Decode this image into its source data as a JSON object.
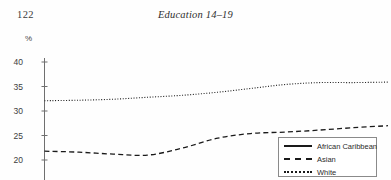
{
  "page": {
    "folio": "122",
    "running_head": "Education 14–19"
  },
  "chart_data": {
    "type": "line",
    "title": "",
    "subtitle": "",
    "xlabel": "",
    "ylabel": "%",
    "ylim": [
      20,
      40
    ],
    "yticks": [
      40,
      35,
      30,
      25,
      20
    ],
    "ytick_labels": [
      "40",
      "35",
      "30",
      "25",
      "20"
    ],
    "grid": false,
    "legend_position": "right",
    "axis_color": "#6f6f6f",
    "line_color": "#1a1a1a",
    "x": [
      0,
      1,
      2,
      3,
      4,
      5,
      6,
      7,
      8,
      9,
      10
    ],
    "series": [
      {
        "name": "African Caribbean",
        "style": "solid",
        "values": [
          null,
          null,
          null,
          null,
          null,
          null,
          13.2,
          14.2,
          null,
          null,
          null
        ],
        "note": "curve enters at lower right, clipped by page crop"
      },
      {
        "name": "Asian",
        "style": "dashed",
        "values": [
          21.8,
          21.6,
          21.2,
          21.0,
          22.4,
          24.4,
          25.4,
          25.7,
          26.1,
          26.6,
          27.0
        ]
      },
      {
        "name": "White",
        "style": "dotted",
        "values": [
          32.1,
          32.2,
          32.4,
          32.8,
          33.2,
          33.8,
          34.6,
          35.4,
          35.8,
          35.8,
          35.9
        ]
      }
    ]
  },
  "legend": {
    "entries": [
      {
        "label": "African Caribbean",
        "style": "solid"
      },
      {
        "label": "Asian",
        "style": "dashed"
      },
      {
        "label": "White",
        "style": "dotted"
      }
    ]
  }
}
